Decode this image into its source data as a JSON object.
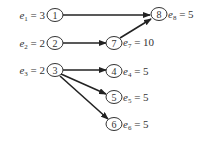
{
  "diagram": {
    "type": "directed-graph",
    "nodes": [
      {
        "id": "1",
        "label": "1",
        "var": "e",
        "sub": "1",
        "value": "3",
        "label_side": "left"
      },
      {
        "id": "2",
        "label": "2",
        "var": "e",
        "sub": "2",
        "value": "2",
        "label_side": "left"
      },
      {
        "id": "3",
        "label": "3",
        "var": "e",
        "sub": "3",
        "value": "2",
        "label_side": "left"
      },
      {
        "id": "4",
        "label": "4",
        "var": "e",
        "sub": "4",
        "value": "5",
        "label_side": "right"
      },
      {
        "id": "5",
        "label": "5",
        "var": "e",
        "sub": "5",
        "value": "5",
        "label_side": "right"
      },
      {
        "id": "6",
        "label": "6",
        "var": "e",
        "sub": "6",
        "value": "5",
        "label_side": "right"
      },
      {
        "id": "7",
        "label": "7",
        "var": "e",
        "sub": "7",
        "value": "10",
        "label_side": "right"
      },
      {
        "id": "8",
        "label": "8",
        "var": "e",
        "sub": "8",
        "value": "5",
        "label_side": "right"
      }
    ],
    "edges": [
      {
        "from": "1",
        "to": "8"
      },
      {
        "from": "2",
        "to": "7"
      },
      {
        "from": "7",
        "to": "8"
      },
      {
        "from": "3",
        "to": "4"
      },
      {
        "from": "3",
        "to": "5"
      },
      {
        "from": "3",
        "to": "6"
      }
    ],
    "eq": " = "
  }
}
